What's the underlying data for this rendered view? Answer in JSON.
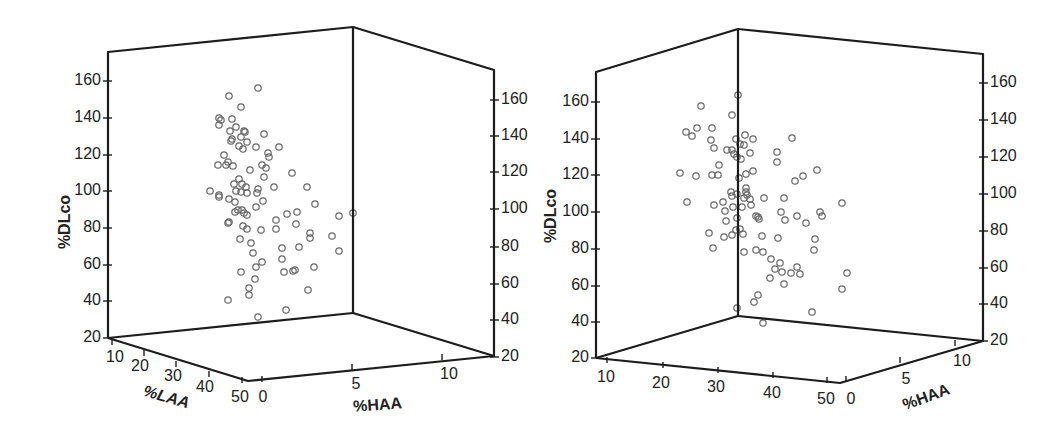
{
  "chart_data": [
    {
      "type": "scatter3d",
      "panel": "left",
      "title": "",
      "axes": {
        "z": {
          "label": "%DLco",
          "ticks": [
            20,
            40,
            60,
            80,
            100,
            120,
            140,
            160
          ],
          "range": [
            20,
            175
          ]
        },
        "x": {
          "label": "%LAA",
          "ticks": [
            10,
            20,
            30,
            40,
            50
          ],
          "range": [
            8,
            52
          ]
        },
        "y": {
          "label": "%HAA",
          "ticks": [
            0,
            5,
            10
          ],
          "range": [
            -0.5,
            12.5
          ]
        }
      },
      "grid": false,
      "legend": null,
      "marker": "open-circle",
      "frame": {
        "front_left_top": [
          108,
          52
        ],
        "front_left_bottom": [
          108,
          338
        ],
        "back_top": [
          353,
          27
        ],
        "back_bottom": [
          353,
          313
        ],
        "right_top": [
          494,
          70
        ],
        "right_bottom": [
          494,
          356
        ],
        "front_bottom": [
          248,
          381
        ]
      },
      "left_ticks": [
        [
          160,
          81
        ],
        [
          140,
          118
        ],
        [
          120,
          155
        ],
        [
          100,
          191
        ],
        [
          80,
          228
        ],
        [
          60,
          265
        ],
        [
          40,
          301
        ],
        [
          20,
          338
        ]
      ],
      "right_ticks": [
        [
          160,
          100
        ],
        [
          140,
          136
        ],
        [
          120,
          172
        ],
        [
          100,
          209
        ],
        [
          80,
          247
        ],
        [
          60,
          284
        ],
        [
          40,
          320
        ],
        [
          20,
          357
        ]
      ],
      "laa_ticks": [
        [
          10,
          112,
          343,
          115,
          358
        ],
        [
          20,
          144,
          354,
          140,
          367
        ],
        [
          30,
          176,
          365,
          173,
          377
        ],
        [
          40,
          209,
          375,
          205,
          388
        ],
        [
          50,
          242,
          381,
          240,
          398
        ]
      ],
      "haa_ticks": [
        [
          0,
          262,
          380,
          263,
          398
        ],
        [
          5,
          352,
          368,
          356,
          385
        ],
        [
          10,
          442,
          358,
          449,
          375
        ]
      ],
      "points_px": [
        [
          229,
          96
        ],
        [
          258,
          88
        ],
        [
          241,
          107
        ],
        [
          219,
          118
        ],
        [
          221,
          120
        ],
        [
          219,
          125
        ],
        [
          232,
          119
        ],
        [
          236,
          127
        ],
        [
          230,
          131
        ],
        [
          244,
          131
        ],
        [
          245,
          132
        ],
        [
          241,
          137
        ],
        [
          232,
          139
        ],
        [
          231,
          141
        ],
        [
          239,
          146
        ],
        [
          243,
          149
        ],
        [
          247,
          142
        ],
        [
          264,
          134
        ],
        [
          256,
          147
        ],
        [
          279,
          147
        ],
        [
          268,
          153
        ],
        [
          269,
          157
        ],
        [
          224,
          155
        ],
        [
          228,
          162
        ],
        [
          218,
          165
        ],
        [
          226,
          165
        ],
        [
          233,
          166
        ],
        [
          250,
          170
        ],
        [
          262,
          165
        ],
        [
          266,
          168
        ],
        [
          264,
          177
        ],
        [
          292,
          173
        ],
        [
          239,
          179
        ],
        [
          234,
          184
        ],
        [
          242,
          184
        ],
        [
          246,
          187
        ],
        [
          236,
          191
        ],
        [
          241,
          192
        ],
        [
          247,
          193
        ],
        [
          258,
          189
        ],
        [
          257,
          193
        ],
        [
          274,
          187
        ],
        [
          307,
          187
        ],
        [
          210,
          191
        ],
        [
          219,
          195
        ],
        [
          219,
          197
        ],
        [
          229,
          199
        ],
        [
          235,
          202
        ],
        [
          263,
          201
        ],
        [
          315,
          204
        ],
        [
          256,
          207
        ],
        [
          238,
          210
        ],
        [
          242,
          210
        ],
        [
          244,
          213
        ],
        [
          247,
          215
        ],
        [
          235,
          212
        ],
        [
          287,
          214
        ],
        [
          297,
          212
        ],
        [
          339,
          216
        ],
        [
          353,
          213
        ],
        [
          276,
          220
        ],
        [
          228,
          223
        ],
        [
          229,
          222
        ],
        [
          243,
          226
        ],
        [
          247,
          229
        ],
        [
          261,
          230
        ],
        [
          276,
          229
        ],
        [
          296,
          224
        ],
        [
          310,
          233
        ],
        [
          310,
          238
        ],
        [
          332,
          236
        ],
        [
          240,
          239
        ],
        [
          251,
          243
        ],
        [
          282,
          248
        ],
        [
          299,
          247
        ],
        [
          339,
          251
        ],
        [
          253,
          253
        ],
        [
          282,
          259
        ],
        [
          262,
          262
        ],
        [
          256,
          267
        ],
        [
          314,
          267
        ],
        [
          241,
          272
        ],
        [
          284,
          272
        ],
        [
          293,
          271
        ],
        [
          295,
          270
        ],
        [
          255,
          279
        ],
        [
          249,
          288
        ],
        [
          249,
          295
        ],
        [
          308,
          290
        ],
        [
          228,
          300
        ],
        [
          286,
          310
        ],
        [
          258,
          317
        ]
      ]
    },
    {
      "type": "scatter3d",
      "panel": "right",
      "title": "",
      "axes": {
        "z": {
          "label": "%DLco",
          "ticks": [
            20,
            40,
            60,
            80,
            100,
            120,
            140,
            160
          ],
          "range": [
            20,
            175
          ]
        },
        "x": {
          "label": "",
          "ticks": [
            10,
            20,
            30,
            40,
            50
          ],
          "range": [
            8,
            52
          ]
        },
        "y": {
          "label": "%HAA",
          "ticks": [
            0,
            5,
            10
          ],
          "range": [
            -0.5,
            12.5
          ]
        }
      },
      "grid": false,
      "legend": null,
      "marker": "open-circle",
      "frame": {
        "left_top": [
          596,
          72
        ],
        "left_bottom": [
          596,
          358
        ],
        "back_top": [
          738,
          29
        ],
        "back_bottom": [
          738,
          316
        ],
        "right_top": [
          983,
          54
        ],
        "right_bottom": [
          983,
          341
        ],
        "front_bottom": [
          840,
          383
        ]
      },
      "left_ticks": [
        [
          160,
          102
        ],
        [
          140,
          139
        ],
        [
          120,
          175
        ],
        [
          100,
          212
        ],
        [
          80,
          249
        ],
        [
          60,
          286
        ],
        [
          40,
          322
        ],
        [
          20,
          358
        ]
      ],
      "right_ticks": [
        [
          160,
          83
        ],
        [
          140,
          120
        ],
        [
          120,
          157
        ],
        [
          100,
          194
        ],
        [
          80,
          231
        ],
        [
          60,
          268
        ],
        [
          40,
          304
        ],
        [
          20,
          341
        ]
      ],
      "laa_ticks": [
        [
          10,
          607,
          361,
          606,
          378
        ],
        [
          20,
          663,
          366,
          661,
          384
        ],
        [
          30,
          718,
          371,
          716,
          388
        ],
        [
          40,
          773,
          376,
          772,
          394
        ],
        [
          50,
          827,
          381,
          826,
          400
        ]
      ],
      "haa_ticks": [
        [
          0,
          846,
          380,
          851,
          400
        ],
        [
          5,
          900,
          361,
          906,
          380
        ],
        [
          10,
          955,
          344,
          962,
          362
        ]
      ],
      "points_px": [
        [
          738,
          95
        ],
        [
          701,
          106
        ],
        [
          732,
          115
        ],
        [
          686,
          132
        ],
        [
          692,
          136
        ],
        [
          697,
          128
        ],
        [
          712,
          128
        ],
        [
          711,
          140
        ],
        [
          714,
          148
        ],
        [
          727,
          150
        ],
        [
          732,
          150
        ],
        [
          736,
          139
        ],
        [
          740,
          144
        ],
        [
          745,
          135
        ],
        [
          753,
          139
        ],
        [
          744,
          145
        ],
        [
          734,
          154
        ],
        [
          737,
          157
        ],
        [
          741,
          159
        ],
        [
          750,
          153
        ],
        [
          777,
          152
        ],
        [
          777,
          162
        ],
        [
          792,
          138
        ],
        [
          719,
          165
        ],
        [
          680,
          173
        ],
        [
          696,
          176
        ],
        [
          712,
          175
        ],
        [
          718,
          175
        ],
        [
          739,
          178
        ],
        [
          746,
          174
        ],
        [
          753,
          171
        ],
        [
          795,
          181
        ],
        [
          803,
          176
        ],
        [
          817,
          170
        ],
        [
          687,
          202
        ],
        [
          714,
          205
        ],
        [
          723,
          202
        ],
        [
          731,
          192
        ],
        [
          732,
          196
        ],
        [
          737,
          194
        ],
        [
          746,
          188
        ],
        [
          746,
          192
        ],
        [
          747,
          195
        ],
        [
          744,
          198
        ],
        [
          750,
          199
        ],
        [
          751,
          205
        ],
        [
          764,
          198
        ],
        [
          784,
          198
        ],
        [
          725,
          211
        ],
        [
          733,
          207
        ],
        [
          742,
          207
        ],
        [
          737,
          218
        ],
        [
          726,
          221
        ],
        [
          756,
          216
        ],
        [
          758,
          217
        ],
        [
          759,
          219
        ],
        [
          781,
          212
        ],
        [
          785,
          220
        ],
        [
          797,
          216
        ],
        [
          806,
          223
        ],
        [
          820,
          212
        ],
        [
          822,
          216
        ],
        [
          842,
          203
        ],
        [
          709,
          233
        ],
        [
          724,
          237
        ],
        [
          732,
          235
        ],
        [
          736,
          230
        ],
        [
          740,
          229
        ],
        [
          743,
          234
        ],
        [
          762,
          236
        ],
        [
          778,
          238
        ],
        [
          815,
          239
        ],
        [
          713,
          248
        ],
        [
          744,
          252
        ],
        [
          756,
          250
        ],
        [
          763,
          252
        ],
        [
          814,
          250
        ],
        [
          771,
          259
        ],
        [
          780,
          263
        ],
        [
          775,
          269
        ],
        [
          782,
          272
        ],
        [
          791,
          273
        ],
        [
          797,
          267
        ],
        [
          800,
          274
        ],
        [
          770,
          278
        ],
        [
          784,
          284
        ],
        [
          847,
          273
        ],
        [
          842,
          289
        ],
        [
          758,
          295
        ],
        [
          754,
          302
        ],
        [
          737,
          308
        ],
        [
          812,
          312
        ],
        [
          763,
          323
        ]
      ]
    }
  ],
  "labels": {
    "left_z": "%DLco",
    "left_x": "%LAA",
    "left_y": "%HAA",
    "right_z": "%DLco",
    "right_y": "%HAA"
  }
}
